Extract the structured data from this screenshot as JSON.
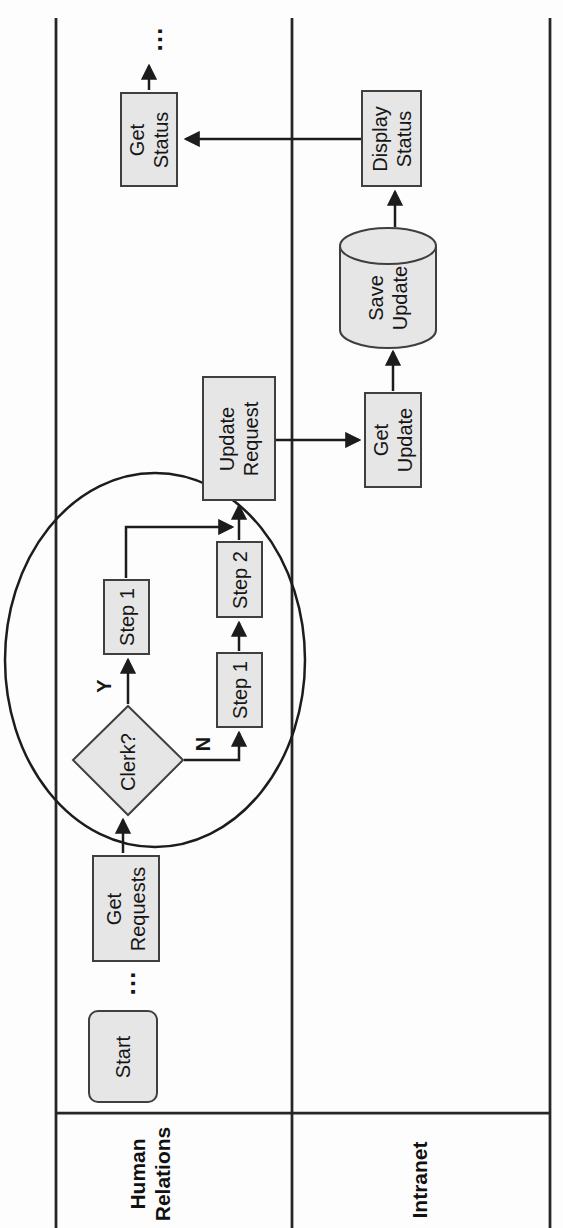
{
  "figure": {
    "type": "swimlane-flowchart",
    "orientation": "rotated-90deg",
    "lanes": [
      {
        "id": "human_relations",
        "label_lines": [
          "Human",
          "Relations"
        ]
      },
      {
        "id": "intranet",
        "label_lines": [
          "Intranet"
        ]
      }
    ]
  },
  "nodes": {
    "start": {
      "shape": "rounded-rect",
      "lane": "human_relations",
      "lines": [
        "Start"
      ]
    },
    "get_requests": {
      "shape": "rect",
      "lane": "human_relations",
      "lines": [
        "Get",
        "Requests"
      ]
    },
    "clerk_decision": {
      "shape": "diamond",
      "lane": "human_relations",
      "lines": [
        "Clerk?"
      ]
    },
    "step1_yes": {
      "shape": "rect",
      "lane": "human_relations",
      "lines": [
        "Step 1"
      ]
    },
    "step1_no": {
      "shape": "rect",
      "lane": "human_relations",
      "lines": [
        "Step 1"
      ]
    },
    "step2": {
      "shape": "rect",
      "lane": "human_relations",
      "lines": [
        "Step 2"
      ]
    },
    "update_request": {
      "shape": "rect",
      "lane": "human_relations",
      "lines": [
        "Update",
        "Request"
      ]
    },
    "get_update": {
      "shape": "rect",
      "lane": "intranet",
      "lines": [
        "Get",
        "Update"
      ]
    },
    "save_update": {
      "shape": "cylinder",
      "lane": "intranet",
      "lines": [
        "Save",
        "Update"
      ]
    },
    "display_status": {
      "shape": "rect",
      "lane": "intranet",
      "lines": [
        "Display",
        "Status"
      ]
    },
    "get_status": {
      "shape": "rect",
      "lane": "human_relations",
      "lines": [
        "Get",
        "Status"
      ]
    }
  },
  "branch_labels": {
    "yes": "Y",
    "no": "N"
  },
  "continuation": {
    "top": "…",
    "bottom": "…"
  },
  "edges": [
    {
      "from": "start",
      "to": "get_requests",
      "style": "broken-by-ellipsis"
    },
    {
      "from": "get_requests",
      "to": "clerk_decision"
    },
    {
      "from": "clerk_decision",
      "to": "step1_yes",
      "label": "Y"
    },
    {
      "from": "clerk_decision",
      "to": "step1_no",
      "label": "N"
    },
    {
      "from": "step1_yes",
      "to": "update_request"
    },
    {
      "from": "step1_no",
      "to": "step2"
    },
    {
      "from": "step2",
      "to": "update_request"
    },
    {
      "from": "update_request",
      "to": "get_update"
    },
    {
      "from": "get_update",
      "to": "save_update"
    },
    {
      "from": "save_update",
      "to": "display_status"
    },
    {
      "from": "display_status",
      "to": "get_status"
    },
    {
      "from": "get_status",
      "to": "continuation-ellipsis"
    }
  ],
  "annotations": {
    "highlight_circle_around": [
      "clerk_decision",
      "step1_yes",
      "step1_no",
      "step2"
    ]
  },
  "colors": {
    "background": "#fdfdfd",
    "shape_fill": "#e6e6e6",
    "shape_border": "#3f3f3f",
    "line": "#1c1c1c",
    "text": "#161616"
  }
}
